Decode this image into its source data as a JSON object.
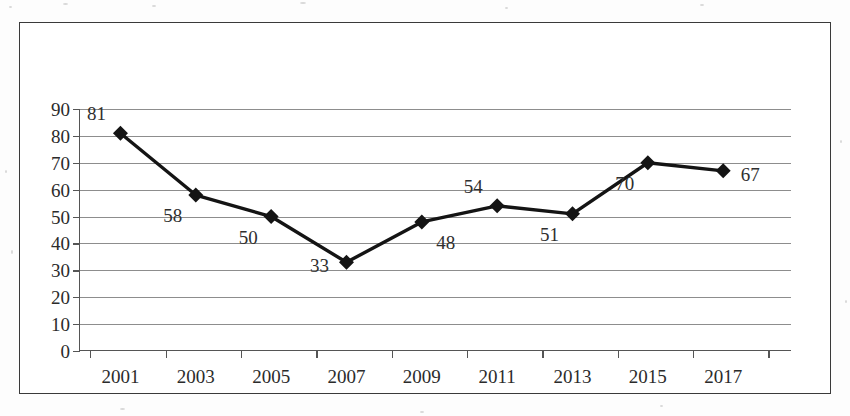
{
  "chart_data": {
    "type": "line",
    "title": "",
    "subtitle": "",
    "xlabel": "",
    "ylabel": "",
    "categories": [
      "2001",
      "2003",
      "2005",
      "2007",
      "2009",
      "2011",
      "2013",
      "2015",
      "2017"
    ],
    "values": [
      81,
      58,
      50,
      33,
      48,
      54,
      51,
      70,
      67
    ],
    "point_labels": [
      "81",
      "58",
      "50",
      "33",
      "48",
      "54",
      "51",
      "70",
      "67"
    ],
    "label_positions": [
      "above-left",
      "below-left",
      "below-left",
      "left",
      "below-right",
      "above-left",
      "below-left",
      "below-left",
      "right"
    ],
    "ylim": [
      0,
      90
    ],
    "y_ticks": [
      "90",
      "80",
      "70",
      "60",
      "50",
      "40",
      "30",
      "20",
      "10",
      "0"
    ],
    "y_tick_values": [
      90,
      80,
      70,
      60,
      50,
      40,
      30,
      20,
      10,
      0
    ],
    "grid": "horizontal",
    "legend": "none",
    "marker": "diamond",
    "line_color": "#141414",
    "marker_color": "#141414",
    "grid_color": "#8d8d8d",
    "axis_color": "#555555",
    "text_color": "#2b2b2b",
    "frame_color": "#3a3a3a",
    "background_color": "#ffffff"
  }
}
